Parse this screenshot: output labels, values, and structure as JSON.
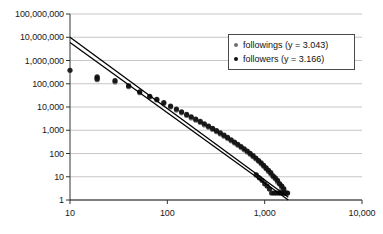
{
  "chart_data": {
    "type": "scatter",
    "title": "",
    "xlabel": "",
    "ylabel": "",
    "xscale": "log",
    "yscale": "log",
    "xlim": [
      10,
      10000
    ],
    "ylim": [
      1,
      100000000
    ],
    "grid": true,
    "grid_axis": "y",
    "legend_position": "top-right",
    "xticks": [
      "10",
      "100",
      "1,000",
      "10,000"
    ],
    "xtick_values": [
      10,
      100,
      1000,
      10000
    ],
    "yticks": [
      "1",
      "10",
      "100",
      "1,000",
      "10,000",
      "100,000",
      "1,000,000",
      "10,000,000",
      "100,000,000"
    ],
    "ytick_values": [
      1,
      10,
      100,
      1000,
      10000,
      100000,
      1000000,
      10000000,
      100000000
    ],
    "series": [
      {
        "name": "followings",
        "legend_label": "followings (y = 3.043)",
        "exponent": 3.043,
        "color": "#6e6e6e",
        "marker": "circle",
        "fit_line": {
          "x": [
            10,
            1750
          ],
          "y": [
            6000000,
            1.0
          ]
        }
      },
      {
        "name": "followers",
        "legend_label": "followers (y = 3.166)",
        "exponent": 3.166,
        "color": "#101010",
        "marker": "circle",
        "fit_line": {
          "x": [
            10,
            1750
          ],
          "y": [
            10000000,
            1.3
          ]
        }
      }
    ],
    "points_followings": [
      [
        19,
        150000
      ],
      [
        19,
        175000
      ],
      [
        29,
        120000
      ],
      [
        40,
        75000
      ],
      [
        52,
        41000
      ],
      [
        66,
        27000
      ],
      [
        78,
        20000
      ],
      [
        92,
        14000
      ],
      [
        108,
        10000
      ],
      [
        124,
        7400
      ],
      [
        140,
        5600
      ],
      [
        158,
        4300
      ],
      [
        176,
        3400
      ],
      [
        196,
        2700
      ],
      [
        218,
        2150
      ],
      [
        240,
        1700
      ],
      [
        265,
        1350
      ],
      [
        292,
        1080
      ],
      [
        320,
        860
      ],
      [
        350,
        690
      ],
      [
        382,
        550
      ],
      [
        416,
        440
      ],
      [
        452,
        350
      ],
      [
        490,
        280
      ],
      [
        530,
        225
      ],
      [
        572,
        180
      ],
      [
        616,
        144
      ],
      [
        662,
        115
      ],
      [
        710,
        92
      ],
      [
        760,
        73
      ],
      [
        812,
        58
      ],
      [
        866,
        46
      ],
      [
        920,
        36
      ],
      [
        976,
        28
      ],
      [
        1034,
        22
      ],
      [
        1094,
        17
      ],
      [
        1156,
        13
      ],
      [
        1220,
        10
      ],
      [
        1286,
        8
      ],
      [
        1354,
        6
      ],
      [
        1424,
        5
      ],
      [
        1496,
        4
      ],
      [
        1570,
        3
      ],
      [
        1646,
        2
      ],
      [
        1500,
        3
      ],
      [
        1610,
        2
      ],
      [
        1700,
        2
      ]
    ],
    "points_followers": [
      [
        10,
        380000
      ],
      [
        19,
        200000
      ],
      [
        19,
        165000
      ],
      [
        29,
        135000
      ],
      [
        40,
        82000
      ],
      [
        52,
        45000
      ],
      [
        66,
        29000
      ],
      [
        78,
        21500
      ],
      [
        92,
        15500
      ],
      [
        108,
        11000
      ],
      [
        124,
        8200
      ],
      [
        140,
        6200
      ],
      [
        158,
        4800
      ],
      [
        176,
        3800
      ],
      [
        196,
        3000
      ],
      [
        218,
        2400
      ],
      [
        240,
        1900
      ],
      [
        265,
        1500
      ],
      [
        292,
        1200
      ],
      [
        320,
        960
      ],
      [
        350,
        770
      ],
      [
        382,
        615
      ],
      [
        416,
        490
      ],
      [
        452,
        390
      ],
      [
        490,
        310
      ],
      [
        530,
        250
      ],
      [
        572,
        200
      ],
      [
        616,
        160
      ],
      [
        662,
        128
      ],
      [
        710,
        102
      ],
      [
        760,
        81
      ],
      [
        812,
        64
      ],
      [
        866,
        50
      ],
      [
        920,
        40
      ],
      [
        976,
        31
      ],
      [
        1034,
        24
      ],
      [
        1094,
        19
      ],
      [
        1156,
        15
      ],
      [
        1220,
        11
      ],
      [
        1286,
        9
      ],
      [
        1354,
        7
      ],
      [
        1424,
        5
      ],
      [
        1496,
        4
      ],
      [
        1570,
        3
      ],
      [
        1646,
        2
      ],
      [
        1720,
        2
      ],
      [
        820,
        12
      ],
      [
        880,
        9
      ],
      [
        940,
        7
      ],
      [
        1000,
        5
      ],
      [
        1060,
        4
      ],
      [
        1120,
        3
      ],
      [
        1180,
        2
      ],
      [
        1250,
        2
      ],
      [
        1320,
        2
      ],
      [
        1390,
        2
      ],
      [
        1460,
        2
      ],
      [
        1530,
        2
      ],
      [
        1600,
        2
      ]
    ]
  }
}
